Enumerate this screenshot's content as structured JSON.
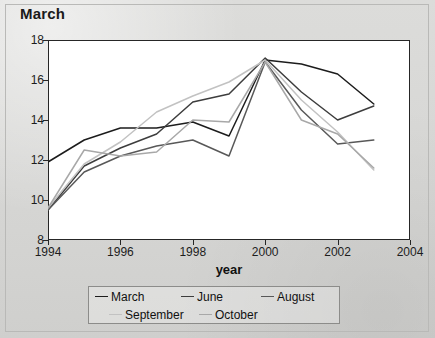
{
  "chart_title": "March",
  "axis": {
    "xlabel": "year",
    "ylabel": "",
    "y_ticks": [
      8,
      10,
      12,
      14,
      16,
      18
    ],
    "x_ticks": [
      1994,
      1996,
      1998,
      2000,
      2002,
      2004
    ]
  },
  "legend": {
    "items": [
      {
        "label": "March",
        "color": "#1c1c1c"
      },
      {
        "label": "June",
        "color": "#3d3d3d"
      },
      {
        "label": "August",
        "color": "#585858"
      },
      {
        "label": "September",
        "color": "#c2c2c2"
      },
      {
        "label": "October",
        "color": "#a8a8a8"
      }
    ]
  },
  "chart_data": {
    "type": "line",
    "title": "March",
    "xlabel": "year",
    "ylabel": "",
    "xlim": [
      1994,
      2004
    ],
    "ylim": [
      8,
      18
    ],
    "grid": false,
    "legend_position": "bottom",
    "x": [
      1994,
      1995,
      1996,
      1997,
      1998,
      1999,
      2000,
      2001,
      2002,
      2003
    ],
    "series": [
      {
        "name": "March",
        "color": "#1c1c1c",
        "values": [
          11.9,
          13.0,
          13.6,
          13.6,
          13.9,
          13.2,
          17.0,
          16.8,
          16.3,
          14.8
        ]
      },
      {
        "name": "June",
        "color": "#3d3d3d",
        "values": [
          9.5,
          11.7,
          12.6,
          13.3,
          14.9,
          15.3,
          17.1,
          15.4,
          14.0,
          14.7
        ]
      },
      {
        "name": "August",
        "color": "#585858",
        "values": [
          9.5,
          11.4,
          12.2,
          12.7,
          13.0,
          12.2,
          16.9,
          14.5,
          12.8,
          13.0
        ]
      },
      {
        "name": "September",
        "color": "#c2c2c2",
        "values": [
          9.6,
          11.8,
          12.9,
          14.4,
          15.2,
          15.9,
          17.0,
          15.0,
          13.4,
          11.5
        ]
      },
      {
        "name": "October",
        "color": "#a8a8a8",
        "values": [
          9.6,
          12.5,
          12.2,
          12.4,
          14.0,
          13.9,
          16.9,
          14.0,
          13.3,
          11.6
        ]
      }
    ]
  }
}
